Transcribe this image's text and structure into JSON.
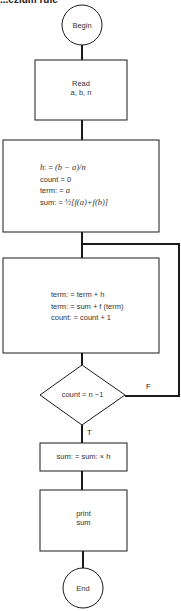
{
  "title": "...ezium rule",
  "nodes": {
    "begin": {
      "label": "Begin"
    },
    "read": {
      "line1": "Read",
      "line2": "a,  b,  n"
    },
    "init": {
      "lines": [
        {
          "lhs": "h",
          "op": ": = ",
          "rhs": "(b − a)/n"
        },
        {
          "lhs": "count",
          "op": " = ",
          "rhs": "0"
        },
        {
          "lhs": "term:",
          "op": " = ",
          "rhs": "a"
        },
        {
          "lhs": "sum:",
          "op": "  = ",
          "rhs": "½[f(a)+f(b)]"
        }
      ]
    },
    "loop": {
      "lines": [
        "term: = term + h",
        "term: = sum + f (term)",
        "count: = count + 1"
      ]
    },
    "decision": {
      "label": "count = n −1",
      "true_label": "T",
      "false_label": "F"
    },
    "finalize": {
      "label": "sum: = sum: × h"
    },
    "print": {
      "line1": "print",
      "line2": "sum"
    },
    "end": {
      "label": "End"
    }
  },
  "colors": {
    "stroke": "#1a1a1a",
    "background": "#ffffff"
  }
}
